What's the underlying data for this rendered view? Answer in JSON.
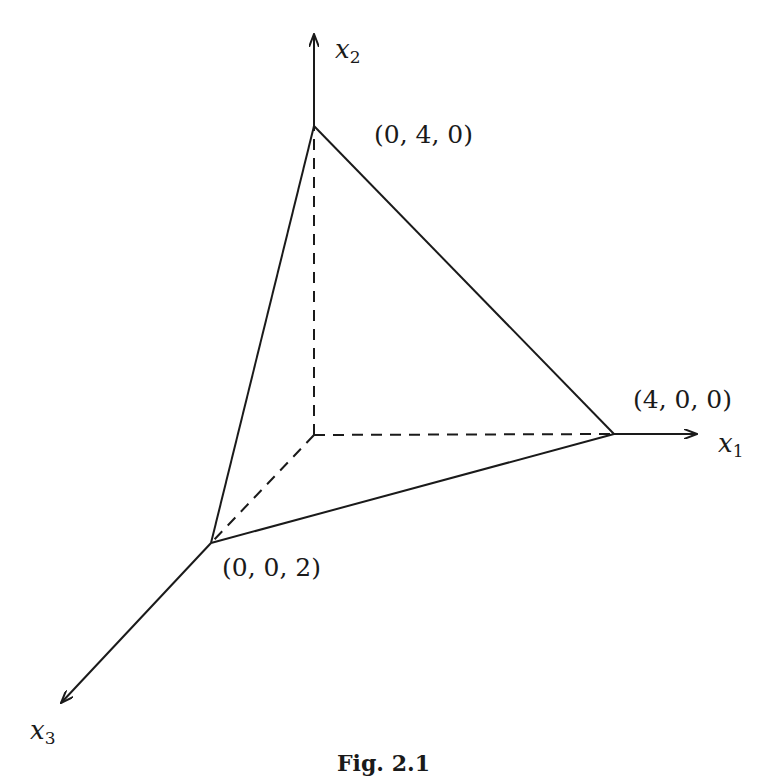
{
  "figure": {
    "caption": "Fig. 2.1",
    "colors": {
      "stroke": "#1a1a1a",
      "background": "#ffffff"
    },
    "axes": [
      {
        "id": "x1",
        "name": "x",
        "subscript": "1",
        "direction": "right"
      },
      {
        "id": "x2",
        "name": "x",
        "subscript": "2",
        "direction": "up"
      },
      {
        "id": "x3",
        "name": "x",
        "subscript": "3",
        "direction": "down-left"
      }
    ],
    "vertices": [
      {
        "id": "v-x2",
        "label": "(0, 4, 0)",
        "coords": [
          0,
          4,
          0
        ]
      },
      {
        "id": "v-x1",
        "label": "(4, 0, 0)",
        "coords": [
          4,
          0,
          0
        ]
      },
      {
        "id": "v-x3",
        "label": "(0, 0, 2)",
        "coords": [
          0,
          0,
          2
        ]
      }
    ],
    "edges": {
      "solid": [
        "(0,4,0)-(4,0,0)",
        "(4,0,0)-(0,0,2)",
        "(0,0,2)-(0,4,0)"
      ],
      "dashed": [
        "origin-(0,4,0)",
        "origin-(4,0,0)",
        "origin-(0,0,2)"
      ]
    }
  }
}
